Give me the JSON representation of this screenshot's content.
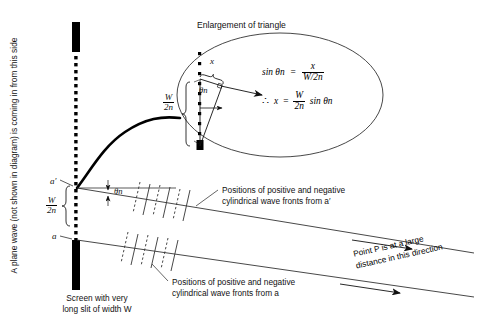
{
  "figure": {
    "title_enlargement": "Enlargement of triangle",
    "side_note": "A plane wave (not shown in diagram) is coming in from this side",
    "caption_screen_line1": "Screen with very",
    "caption_screen_line2": "long slit of width W",
    "caption_wavefront_top_line1": "Positions of positive and negative",
    "caption_wavefront_top_line2": "cylindrical wave fronts from a′",
    "caption_wavefront_bottom_line1": "Positions of positive and negative",
    "caption_wavefront_bottom_line2": "cylindrical wave fronts from a",
    "caption_point_p_line1": "Point P is at a large",
    "caption_point_p_line2": "distance in this direction"
  },
  "labels": {
    "a_prime": "a′",
    "a": "a",
    "x": "x",
    "theta_n": "θn",
    "W": "W",
    "two_n": "2n"
  },
  "equations": {
    "eq1_lhs": "sin θn",
    "eq1_eq": "=",
    "eq1_num": "x",
    "eq1_den": "W/2n",
    "eq2_therefore": "∴",
    "eq2_lhs": "x",
    "eq2_eq": "=",
    "eq2_num": "W",
    "eq2_den": "2n",
    "eq2_tail": "sin θn"
  },
  "colors": {
    "ink": "#000000",
    "background": "#ffffff",
    "line": "#2a2a2a"
  }
}
